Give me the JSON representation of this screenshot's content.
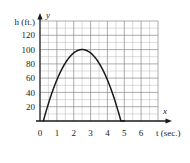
{
  "chart_data": {
    "type": "line",
    "title": "",
    "xlabel": "t (sec.)",
    "ylabel": "h (ft.)",
    "x_axis_letter": "x",
    "y_axis_letter": "y",
    "xlim": [
      0,
      7
    ],
    "ylim": [
      0,
      140
    ],
    "xticks": [
      "0",
      "1",
      "2",
      "3",
      "4",
      "5",
      "6"
    ],
    "xtick_values": [
      0,
      1,
      2,
      3,
      4,
      5,
      6
    ],
    "yticks": [
      "20",
      "40",
      "60",
      "80",
      "100",
      "120"
    ],
    "ytick_values": [
      20,
      40,
      60,
      80,
      100,
      120
    ],
    "grid": true,
    "grid_minor_step_x": 0.5,
    "grid_minor_step_y": 10,
    "grid_major_step_x": 1,
    "grid_major_step_y": 20,
    "legend": "none",
    "series": [
      {
        "name": "height",
        "color": "#1a1a1a",
        "x": [
          0.21,
          0.4,
          0.6,
          0.8,
          1.0,
          1.2,
          1.4,
          1.6,
          1.8,
          2.0,
          2.2,
          2.4,
          2.6,
          2.8,
          3.0,
          3.2,
          3.4,
          3.6,
          3.8,
          4.0,
          4.2,
          4.4,
          4.6,
          4.8,
          5.0
        ],
        "y": [
          0,
          19.3,
          36.9,
          52.1,
          64.8,
          75.1,
          83.0,
          88.4,
          91.4,
          92.0,
          99.3,
          99.9,
          99.8,
          98.0,
          94.4,
          89.4,
          83.0,
          75.1,
          65.7,
          54.9,
          42.6,
          28.9,
          19.3,
          10.0,
          0
        ]
      }
    ],
    "curve_peak": {
      "t": 2.5,
      "h": 100
    },
    "curve_start": {
      "t": 0.2,
      "h": 0
    },
    "curve_end": {
      "t": 5.0,
      "h": 0
    }
  },
  "colors": {
    "axis": "#1a1a1a",
    "grid_minor": "#b9b9b9",
    "grid_major": "#8a8a8a",
    "curve": "#1a1a1a",
    "background": "#ffffff"
  }
}
